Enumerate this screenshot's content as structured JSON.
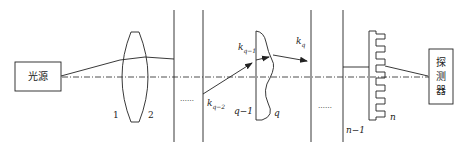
{
  "diagram": {
    "type": "optical-system-schematic",
    "source_box": {
      "label": "光源"
    },
    "detector_box": {
      "label_lines": [
        "探",
        "测",
        "器"
      ]
    },
    "lens_labels": {
      "surface1": "1",
      "surface2": "2"
    },
    "ellipsis": "……",
    "vectors": {
      "k_q_minus_2": {
        "base": "k",
        "sub": "q−2"
      },
      "k_q_minus_1": {
        "base": "k",
        "sub": "q−1"
      },
      "k_q": {
        "base": "k",
        "sub": "q"
      }
    },
    "surface_labels": {
      "q_minus_1": "q−1",
      "q": "q",
      "n_minus_1": "n−1",
      "n": "n"
    },
    "colors": {
      "line": "#222222",
      "background": "#ffffff"
    }
  }
}
